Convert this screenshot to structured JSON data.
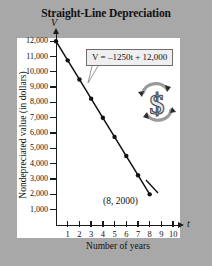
{
  "figure": {
    "title": "Straight-Line Depreciation",
    "background_color": "#a8a8a8",
    "panel_color": "#ffffff"
  },
  "equation": {
    "text": "V = –1250t + 12,000"
  },
  "annotation": {
    "point_label": "(8, 2000)"
  },
  "emblem": {
    "name": "dollar-sign-recycle-emblem"
  },
  "chart_data": {
    "type": "line",
    "title": "Straight-Line Depreciation",
    "xlabel": "Number of years",
    "ylabel": "Nondepreciated value (in dollars)",
    "x_axis_variable": "t",
    "y_axis_variable": "V",
    "equation": "V = -1250t + 12,000",
    "slope": -1250,
    "intercept": 12000,
    "xlim": [
      0,
      10.5
    ],
    "ylim": [
      0,
      12600
    ],
    "grid": false,
    "legend": null,
    "x_tick_labels": [
      "1",
      "2",
      "3",
      "4",
      "5",
      "6",
      "7",
      "8",
      "9",
      "10"
    ],
    "x_ticks": [
      1,
      2,
      3,
      4,
      5,
      6,
      7,
      8,
      9,
      10
    ],
    "y_tick_labels": [
      "12,000",
      "11,000",
      "10,000",
      "9,000",
      "8,000",
      "7,000",
      "6,000",
      "5,000",
      "4,000",
      "3,000",
      "2,000",
      "1,000"
    ],
    "y_ticks": [
      12000,
      11000,
      10000,
      9000,
      8000,
      7000,
      6000,
      5000,
      4000,
      3000,
      2000,
      1000
    ],
    "series": [
      {
        "name": "Nondepreciated value",
        "marker": "filled-circle",
        "color": "#111111",
        "x": [
          0,
          1,
          2,
          3,
          4,
          5,
          6,
          7,
          8
        ],
        "y": [
          12000,
          10750,
          9500,
          8250,
          7000,
          5750,
          4500,
          3250,
          2000
        ]
      }
    ],
    "annotations": [
      {
        "text": "V = -1250t + 12,000",
        "type": "callout-box",
        "points_to": [
          2,
          9500
        ]
      },
      {
        "text": "(8, 2000)",
        "type": "point-label",
        "points_to": [
          8,
          2000
        ]
      }
    ]
  }
}
